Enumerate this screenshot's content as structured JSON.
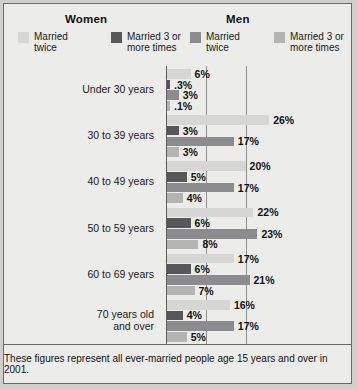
{
  "header": {
    "women_title": "Women",
    "men_title": "Men",
    "legend": [
      {
        "label": "Married\ntwice",
        "group": "Women",
        "color": "#d6d6d4",
        "name": "legend-women-twice"
      },
      {
        "label": "Married 3 or\nmore times",
        "group": "Women",
        "color": "#58585a",
        "name": "legend-women-three-plus"
      },
      {
        "label": "Married\ntwice",
        "group": "Men",
        "color": "#8c8c8e",
        "name": "legend-men-twice"
      },
      {
        "label": "Married 3 or\nmore times",
        "group": "Men",
        "color": "#b4b4b2",
        "name": "legend-men-three-plus"
      }
    ]
  },
  "footnote": "These figures represent all ever-married people age 15 years and over in 2001.",
  "chart_data": {
    "type": "bar",
    "orientation": "horizontal",
    "title": "",
    "xlabel": "",
    "ylabel": "",
    "xlim": [
      0,
      30
    ],
    "grid": true,
    "gridlines": [
      10,
      20
    ],
    "legend_position": "top",
    "categories": [
      "Under 30 years",
      "30 to 39 years",
      "40 to 49 years",
      "50 to 59 years",
      "60 to 69 years",
      "70 years old\nand over"
    ],
    "series": [
      {
        "name": "Women married twice",
        "color": "#d6d6d4",
        "values": [
          6,
          26,
          20,
          22,
          17,
          16
        ],
        "labels": [
          "6%",
          "26%",
          "20%",
          "22%",
          "17%",
          "16%"
        ]
      },
      {
        "name": "Women married 3 or more times",
        "color": "#58585a",
        "values": [
          0.3,
          3,
          5,
          6,
          6,
          4
        ],
        "labels": [
          ".3%",
          "3%",
          "5%",
          "6%",
          "6%",
          "4%"
        ]
      },
      {
        "name": "Men married twice",
        "color": "#8c8c8e",
        "values": [
          3,
          17,
          17,
          23,
          21,
          17
        ],
        "labels": [
          "3%",
          "17%",
          "17%",
          "23%",
          "21%",
          "17%"
        ]
      },
      {
        "name": "Men married 3 or more times",
        "color": "#b4b4b2",
        "values": [
          0.1,
          3,
          4,
          8,
          7,
          5
        ],
        "labels": [
          ".1%",
          "3%",
          "4%",
          "8%",
          "7%",
          "5%"
        ]
      }
    ]
  }
}
